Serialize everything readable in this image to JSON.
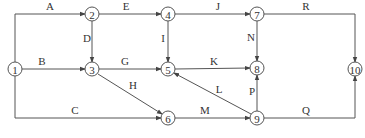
{
  "diagram": {
    "type": "activity-on-arrow network",
    "node_radius": 7,
    "colors": {
      "stroke": "#555555",
      "text": "#333333",
      "background": "#ffffff"
    },
    "nodes": [
      {
        "id": "1",
        "label": "1",
        "x": 15,
        "y": 69
      },
      {
        "id": "2",
        "label": "2",
        "x": 92,
        "y": 14
      },
      {
        "id": "3",
        "label": "3",
        "x": 92,
        "y": 69
      },
      {
        "id": "4",
        "label": "4",
        "x": 168,
        "y": 14
      },
      {
        "id": "5",
        "label": "5",
        "x": 168,
        "y": 69
      },
      {
        "id": "6",
        "label": "6",
        "x": 168,
        "y": 118
      },
      {
        "id": "7",
        "label": "7",
        "x": 257,
        "y": 14
      },
      {
        "id": "8",
        "label": "8",
        "x": 257,
        "y": 68
      },
      {
        "id": "9",
        "label": "9",
        "x": 257,
        "y": 118
      },
      {
        "id": "10",
        "label": "10",
        "x": 355,
        "y": 69
      }
    ],
    "edges": [
      {
        "label": "A",
        "from": "1",
        "to": "2",
        "points": [
          [
            15,
            62
          ],
          [
            15,
            14
          ],
          [
            85,
            14
          ]
        ],
        "label_pos": [
          50,
          10
        ]
      },
      {
        "label": "B",
        "from": "1",
        "to": "3",
        "points": [
          [
            22,
            69
          ],
          [
            85,
            69
          ]
        ],
        "label_pos": [
          42,
          65
        ]
      },
      {
        "label": "C",
        "from": "1",
        "to": "6",
        "points": [
          [
            15,
            76
          ],
          [
            15,
            118
          ],
          [
            161,
            118
          ]
        ],
        "label_pos": [
          75,
          114
        ]
      },
      {
        "label": "D",
        "from": "2",
        "to": "3",
        "points": [
          [
            92,
            21
          ],
          [
            92,
            62
          ]
        ],
        "label_pos": [
          87,
          42
        ]
      },
      {
        "label": "E",
        "from": "2",
        "to": "4",
        "points": [
          [
            99,
            14
          ],
          [
            161,
            14
          ]
        ],
        "label_pos": [
          126,
          10
        ]
      },
      {
        "label": "G",
        "from": "3",
        "to": "5",
        "points": [
          [
            99,
            69
          ],
          [
            161,
            69
          ]
        ],
        "label_pos": [
          125,
          65
        ]
      },
      {
        "label": "H",
        "from": "3",
        "to": "6",
        "points": [
          [
            98,
            74
          ],
          [
            162,
            114
          ]
        ],
        "label_pos": [
          133,
          89
        ]
      },
      {
        "label": "I",
        "from": "4",
        "to": "5",
        "points": [
          [
            168,
            21
          ],
          [
            168,
            62
          ]
        ],
        "label_pos": [
          163,
          42
        ]
      },
      {
        "label": "J",
        "from": "4",
        "to": "7",
        "points": [
          [
            175,
            14
          ],
          [
            250,
            14
          ]
        ],
        "label_pos": [
          218,
          10
        ]
      },
      {
        "label": "K",
        "from": "5",
        "to": "8",
        "points": [
          [
            175,
            69
          ],
          [
            250,
            68
          ]
        ],
        "label_pos": [
          214,
          65
        ]
      },
      {
        "label": "L",
        "from": "9",
        "to": "5",
        "points": [
          [
            251,
            114
          ],
          [
            174,
            73
          ]
        ],
        "label_pos": [
          219,
          93
        ]
      },
      {
        "label": "M",
        "from": "6",
        "to": "9",
        "points": [
          [
            175,
            118
          ],
          [
            250,
            118
          ]
        ],
        "label_pos": [
          205,
          114
        ]
      },
      {
        "label": "N",
        "from": "7",
        "to": "8",
        "points": [
          [
            257,
            21
          ],
          [
            257,
            61
          ]
        ],
        "label_pos": [
          251,
          41
        ]
      },
      {
        "label": "P",
        "from": "9",
        "to": "8",
        "points": [
          [
            257,
            111
          ],
          [
            257,
            75
          ]
        ],
        "label_pos": [
          252,
          95
        ]
      },
      {
        "label": "Q",
        "from": "9",
        "to": "10",
        "points": [
          [
            264,
            118
          ],
          [
            355,
            118
          ],
          [
            355,
            76
          ]
        ],
        "label_pos": [
          306,
          114
        ]
      },
      {
        "label": "R",
        "from": "7",
        "to": "10",
        "points": [
          [
            264,
            14
          ],
          [
            355,
            14
          ],
          [
            355,
            62
          ]
        ],
        "label_pos": [
          306,
          10
        ]
      }
    ]
  }
}
